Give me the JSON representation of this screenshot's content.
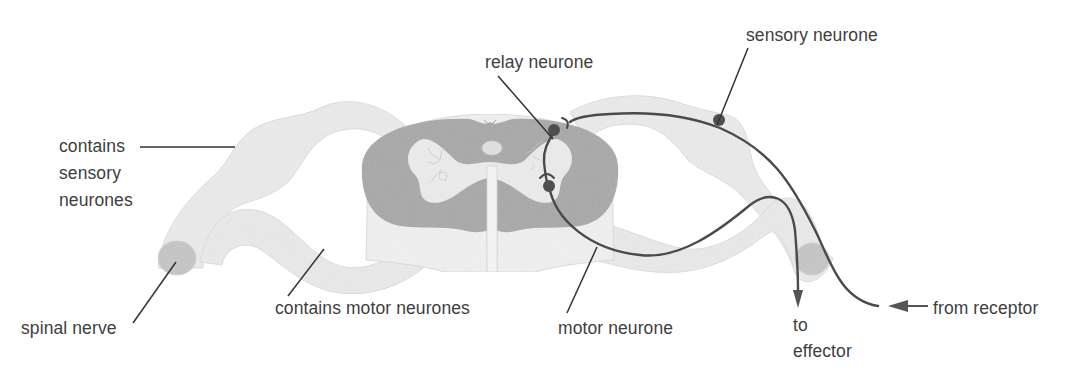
{
  "diagram": {
    "colors": {
      "nerve_fill": "#ececec",
      "nerve_edge": "#d9d9d9",
      "grey_matter": "#a9a9a9",
      "white_matter_light": "#f1f1f1",
      "neurone_line": "#4a4a4a",
      "cell_body": "#4f4f4f",
      "nerve_cut_end": "#c4c4c4",
      "leader_line": "#333333",
      "label_text": "#3e3e3e"
    },
    "labels": {
      "relay_neurone": "relay neurone",
      "sensory_neurone": "sensory neurone",
      "contains_sensory_1": "contains",
      "contains_sensory_2": "sensory",
      "contains_sensory_3": "neurones",
      "spinal_nerve": "spinal nerve",
      "contains_motor": "contains motor neurones",
      "motor_neurone": "motor neurone",
      "to_effector_1": "to",
      "to_effector_2": "effector",
      "from_receptor": "from receptor"
    },
    "arrows": {
      "to_effector": "down-arrow",
      "from_receptor": "left-arrow"
    }
  }
}
